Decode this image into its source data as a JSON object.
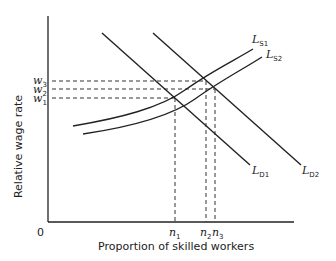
{
  "diagram": {
    "ylabel": "Relative wage rate",
    "xlabel": "Proportion of skilled workers",
    "origin": "0",
    "y_ticks": [
      {
        "main": "w",
        "sub": "3"
      },
      {
        "main": "w",
        "sub": "2"
      },
      {
        "main": "w",
        "sub": "1"
      }
    ],
    "x_ticks": [
      {
        "main": "n",
        "sub": "1"
      },
      {
        "main": "n",
        "sub": "2"
      },
      {
        "main": "n",
        "sub": "3"
      }
    ],
    "curves": {
      "ls1": {
        "main": "L",
        "sub": "S1"
      },
      "ls2": {
        "main": "L",
        "sub": "S2"
      },
      "ld1": {
        "main": "L",
        "sub": "D1"
      },
      "ld2": {
        "main": "L",
        "sub": "D2"
      }
    }
  }
}
